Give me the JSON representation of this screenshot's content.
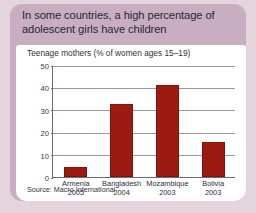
{
  "headline": "In some countries, a high percentage of adolescent girls have children",
  "colors": {
    "page_background": "#e4d4de",
    "card_background": "#c9aec1",
    "panel_background": "#ffffff",
    "bar": "#9d1a11",
    "text": "#2a2636",
    "gridline": "#9a979e",
    "axis": "#6d6a72"
  },
  "source": "Source: Macro International",
  "chart_data": {
    "type": "bar",
    "title": "Teenage mothers (% of women ages 15–19)",
    "xlabel": "",
    "ylabel": "",
    "categories": [
      "Armenia",
      "Bangladesh",
      "Mozambique",
      "Bolivia"
    ],
    "category_years": [
      "2005",
      "2004",
      "2003",
      "2003"
    ],
    "values": [
      4.5,
      32.5,
      41,
      15.5
    ],
    "ylim": [
      0,
      50
    ],
    "yticks": [
      0,
      10,
      20,
      30,
      40,
      50
    ],
    "ytick_labels": [
      "0",
      "10",
      "20",
      "30",
      "40",
      "50"
    ],
    "grid": true,
    "legend": false,
    "series": [
      {
        "name": "Teenage mothers (% of women ages 15–19)",
        "values": [
          4.5,
          32.5,
          41,
          15.5
        ]
      }
    ]
  }
}
